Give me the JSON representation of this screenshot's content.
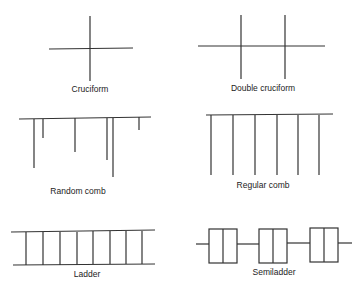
{
  "diagrams": [
    {
      "id": "cruciform",
      "label": "Cruciform"
    },
    {
      "id": "double-cruciform",
      "label": "Double cruciform"
    },
    {
      "id": "random-comb",
      "label": "Random comb"
    },
    {
      "id": "regular-comb",
      "label": "Regular comb"
    },
    {
      "id": "ladder",
      "label": "Ladder"
    },
    {
      "id": "semiladder",
      "label": "Semiladder"
    }
  ],
  "colors": {
    "line": "#333333",
    "background": "#ffffff"
  }
}
